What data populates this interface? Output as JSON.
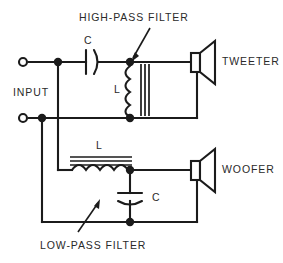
{
  "diagram": {
    "ink_color": "#1b1b1b",
    "background_color": "#ffffff",
    "labels": {
      "high_pass": "HIGH-PASS FILTER",
      "low_pass": "LOW-PASS FILTER",
      "input": "INPUT",
      "tweeter": "TWEETER",
      "woofer": "WOOFER",
      "cap_high": "C",
      "ind_high": "L",
      "ind_low": "L",
      "cap_low": "C"
    },
    "components": [
      {
        "id": "c-high",
        "type": "capacitor",
        "orientation": "horizontal",
        "label": "C",
        "branch": "high-pass",
        "position": "series"
      },
      {
        "id": "l-high",
        "type": "inductor-iron-core",
        "orientation": "vertical",
        "label": "L",
        "branch": "high-pass",
        "position": "shunt"
      },
      {
        "id": "l-low",
        "type": "inductor-iron-core",
        "orientation": "horizontal",
        "label": "L",
        "branch": "low-pass",
        "position": "series"
      },
      {
        "id": "c-low",
        "type": "capacitor",
        "orientation": "vertical",
        "label": "C",
        "branch": "low-pass",
        "position": "shunt"
      },
      {
        "id": "tweeter",
        "type": "loudspeaker",
        "label": "TWEETER",
        "branch": "high-pass"
      },
      {
        "id": "woofer",
        "type": "loudspeaker",
        "label": "WOOFER",
        "branch": "low-pass"
      }
    ],
    "terminals": [
      {
        "id": "input-top",
        "label": "INPUT",
        "style": "open-circle"
      },
      {
        "id": "input-bottom",
        "label": "INPUT",
        "style": "open-circle"
      }
    ],
    "junction_count": 6,
    "annotations": [
      {
        "text": "HIGH-PASS FILTER",
        "points_to": "l-high"
      },
      {
        "text": "LOW-PASS FILTER",
        "points_to": "c-low"
      }
    ]
  }
}
